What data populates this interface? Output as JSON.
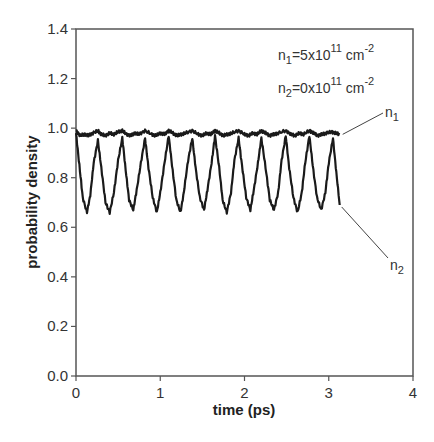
{
  "chart_data": {
    "type": "line",
    "title": "",
    "xlabel": "time (ps)",
    "ylabel": "probability density",
    "xlim": [
      0,
      4
    ],
    "ylim": [
      0.0,
      1.4
    ],
    "xticks": [
      "0",
      "1",
      "2",
      "3",
      "4"
    ],
    "yticks": [
      "0.0",
      "0.2",
      "0.4",
      "0.6",
      "0.8",
      "1.0",
      "1.2",
      "1.4"
    ],
    "grid": false,
    "annotations": [
      {
        "text": "n1=5x10^11 cm^-2",
        "base": "n",
        "sub": "1",
        "mid": "=5x10",
        "sup1": "11",
        "unit": " cm",
        "sup2": "-2"
      },
      {
        "text": "n2=0x10^11 cm^-2",
        "base": "n",
        "sub": "2",
        "mid": "=0x10",
        "sup1": "11",
        "unit": " cm",
        "sup2": "-2"
      }
    ],
    "series": [
      {
        "name": "n1",
        "label_base": "n",
        "label_sub": "1",
        "color": "#1a1a1a",
        "x": [
          0.0,
          0.05,
          0.1,
          0.15,
          0.2,
          0.26,
          0.3,
          0.35,
          0.4,
          0.45,
          0.5,
          0.55,
          0.6,
          0.65,
          0.7,
          0.75,
          0.82,
          0.9,
          0.95,
          1.0,
          1.05,
          1.1,
          1.15,
          1.2,
          1.25,
          1.3,
          1.38,
          1.45,
          1.5,
          1.55,
          1.6,
          1.65,
          1.7,
          1.75,
          1.8,
          1.85,
          1.93,
          2.0,
          2.05,
          2.1,
          2.15,
          2.2,
          2.25,
          2.3,
          2.35,
          2.4,
          2.49,
          2.55,
          2.6,
          2.65,
          2.7,
          2.77,
          2.82,
          2.87,
          2.92,
          2.97,
          3.03,
          3.08,
          3.13
        ],
        "values": [
          0.99,
          0.97,
          0.975,
          0.97,
          0.98,
          0.99,
          0.975,
          0.97,
          0.98,
          0.975,
          0.985,
          0.99,
          0.975,
          0.97,
          0.98,
          0.975,
          0.99,
          0.975,
          0.97,
          0.98,
          0.975,
          0.99,
          0.98,
          0.97,
          0.975,
          0.98,
          0.99,
          0.975,
          0.97,
          0.98,
          0.975,
          0.99,
          0.98,
          0.97,
          0.975,
          0.98,
          0.99,
          0.975,
          0.97,
          0.98,
          0.975,
          0.99,
          0.98,
          0.97,
          0.975,
          0.98,
          0.99,
          0.975,
          0.97,
          0.98,
          0.975,
          0.99,
          0.98,
          0.97,
          0.975,
          0.98,
          0.985,
          0.98,
          0.975
        ]
      },
      {
        "name": "n2",
        "label_base": "n",
        "label_sub": "2",
        "color": "#1a1a1a",
        "x": [
          0.0,
          0.04,
          0.08,
          0.13,
          0.17,
          0.21,
          0.26,
          0.3,
          0.35,
          0.4,
          0.45,
          0.5,
          0.55,
          0.59,
          0.63,
          0.68,
          0.72,
          0.77,
          0.82,
          0.86,
          0.91,
          0.96,
          1.0,
          1.05,
          1.1,
          1.14,
          1.19,
          1.24,
          1.28,
          1.33,
          1.38,
          1.42,
          1.47,
          1.52,
          1.56,
          1.61,
          1.65,
          1.7,
          1.74,
          1.79,
          1.84,
          1.88,
          1.93,
          1.97,
          2.02,
          2.07,
          2.11,
          2.16,
          2.2,
          2.25,
          2.3,
          2.35,
          2.4,
          2.44,
          2.49,
          2.53,
          2.58,
          2.63,
          2.68,
          2.72,
          2.77,
          2.81,
          2.86,
          2.91,
          2.96,
          3.0,
          3.05,
          3.09,
          3.13
        ],
        "values": [
          0.98,
          0.85,
          0.72,
          0.66,
          0.73,
          0.86,
          0.95,
          0.84,
          0.7,
          0.66,
          0.74,
          0.87,
          0.96,
          0.83,
          0.71,
          0.67,
          0.75,
          0.86,
          0.96,
          0.84,
          0.72,
          0.66,
          0.74,
          0.86,
          0.97,
          0.85,
          0.71,
          0.66,
          0.74,
          0.87,
          0.96,
          0.84,
          0.72,
          0.67,
          0.75,
          0.86,
          0.97,
          0.84,
          0.71,
          0.66,
          0.74,
          0.87,
          0.96,
          0.85,
          0.72,
          0.67,
          0.75,
          0.86,
          0.96,
          0.84,
          0.71,
          0.67,
          0.74,
          0.87,
          0.97,
          0.84,
          0.72,
          0.66,
          0.74,
          0.86,
          0.97,
          0.85,
          0.72,
          0.67,
          0.74,
          0.86,
          0.96,
          0.82,
          0.69
        ]
      }
    ],
    "legend_position": "inline-right"
  }
}
